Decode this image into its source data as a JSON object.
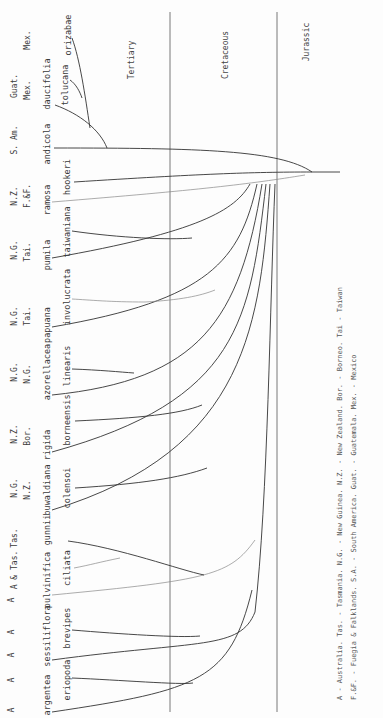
{
  "diagram": {
    "type": "phylogenetic-tree",
    "orientation": "rotated-90-ccw",
    "periods": [
      "Tertiary",
      "Cretaceous",
      "Jurassic"
    ],
    "taxa": [
      {
        "name": "orizabae",
        "region": "Mex."
      },
      {
        "name": "tolucana",
        "region": ""
      },
      {
        "name": "daucifolia",
        "region": "Guat. Mex."
      },
      {
        "name": "andicola",
        "region": "S. Am."
      },
      {
        "name": "hookeri",
        "region": "F.&F."
      },
      {
        "name": "ramosa",
        "region": "N.Z."
      },
      {
        "name": "taiwaniana",
        "region": "Tai."
      },
      {
        "name": "pumila",
        "region": "N.G."
      },
      {
        "name": "involucrata",
        "region": "Tai."
      },
      {
        "name": "papuana",
        "region": "N.G."
      },
      {
        "name": "linearis",
        "region": "N.G."
      },
      {
        "name": "azorellacea",
        "region": "N.G."
      },
      {
        "name": "borneensis",
        "region": "Bor."
      },
      {
        "name": "rigida",
        "region": "N.Z."
      },
      {
        "name": "colensoi",
        "region": "N.Z."
      },
      {
        "name": "buwaldiana",
        "region": "N.G."
      },
      {
        "name": "gunnii",
        "region": "Tas."
      },
      {
        "name": "ciliata",
        "region": "A & Tas."
      },
      {
        "name": "pulvinifica",
        "region": "A"
      },
      {
        "name": "brevipes",
        "region": "A"
      },
      {
        "name": "sessiliflora",
        "region": "A"
      },
      {
        "name": "eriopoda",
        "region": "A"
      },
      {
        "name": "argentea",
        "region": "A"
      }
    ],
    "region_rows": [
      {
        "top": "Mex.",
        "bottom": ""
      },
      {
        "top": "Guat.",
        "bottom": "Mex."
      },
      {
        "top": "S. Am.",
        "bottom": ""
      },
      {
        "top": "N.Z.",
        "bottom": "F.&F."
      },
      {
        "top": "N.G.",
        "bottom": "Tai."
      },
      {
        "top": "N.G.",
        "bottom": "Tai."
      },
      {
        "top": "N.G.",
        "bottom": "N.G."
      },
      {
        "top": "N.Z.",
        "bottom": "Bor."
      },
      {
        "top": "N.G.",
        "bottom": "N.Z."
      },
      {
        "top": "A & Tas.",
        "bottom": "Tas."
      },
      {
        "top": "A",
        "bottom": "A"
      },
      {
        "top": "A",
        "bottom": "A"
      },
      {
        "top": "A",
        "bottom": ""
      }
    ],
    "legend": {
      "line1": "A - Australia.   Tas. - Tasmania.   N.G. - New Guinea.   N.Z. - New Zealand.   Bor. - Borneo.   Tai - Taiwan",
      "line2": "F.&F. - Fuegia & Falklands.   S.A. - South America.   Guat. - Guatemala.   Mex. - Mexico"
    }
  }
}
